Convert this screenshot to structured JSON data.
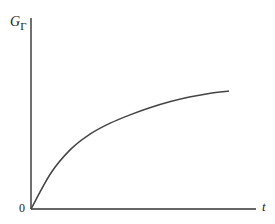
{
  "chart_data": {
    "type": "line",
    "title": "",
    "xlabel": "t",
    "ylabel_main": "G",
    "ylabel_sub": "Γ",
    "origin_label": "0",
    "grid": false,
    "legend": null,
    "series": [
      {
        "name": "G_Gamma(t)",
        "x": [
          0,
          0.1,
          0.2,
          0.3,
          0.4,
          0.5,
          0.6,
          0.7,
          0.8,
          0.9,
          1.0
        ],
        "values": [
          0,
          0.3,
          0.5,
          0.63,
          0.72,
          0.79,
          0.85,
          0.9,
          0.94,
          0.97,
          0.99
        ]
      }
    ],
    "xlim": [
      0,
      1.2
    ],
    "ylim": [
      0,
      1.05
    ],
    "ticks": {
      "x": [],
      "y": []
    }
  },
  "colors": {
    "axis": "#333333",
    "curve": "#444444",
    "background": "#ffffff"
  }
}
